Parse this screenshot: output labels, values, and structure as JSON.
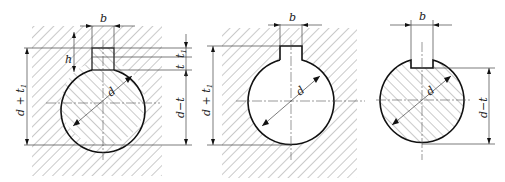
{
  "figure": {
    "colors": {
      "line": "#111111",
      "hatch": "#666666",
      "background": "#ffffff"
    },
    "views": [
      {
        "id": "assembly",
        "title": "Shaft and hub with key",
        "labels": {
          "key_width": "b",
          "key_height": "h",
          "shaft_depth": "t",
          "hub_depth": "t",
          "hub_depth_sub": "1",
          "diameter": "d",
          "hub_dim": "d + t",
          "hub_dim_sub": "1",
          "shaft_dim": "d−t"
        }
      },
      {
        "id": "hub",
        "title": "Hub keyway",
        "labels": {
          "key_width": "b",
          "diameter": "d",
          "hub_dim": "d + t",
          "hub_dim_sub": "1"
        }
      },
      {
        "id": "shaft",
        "title": "Shaft keyway",
        "labels": {
          "key_width": "b",
          "diameter": "d",
          "shaft_dim": "d−t"
        }
      }
    ]
  }
}
